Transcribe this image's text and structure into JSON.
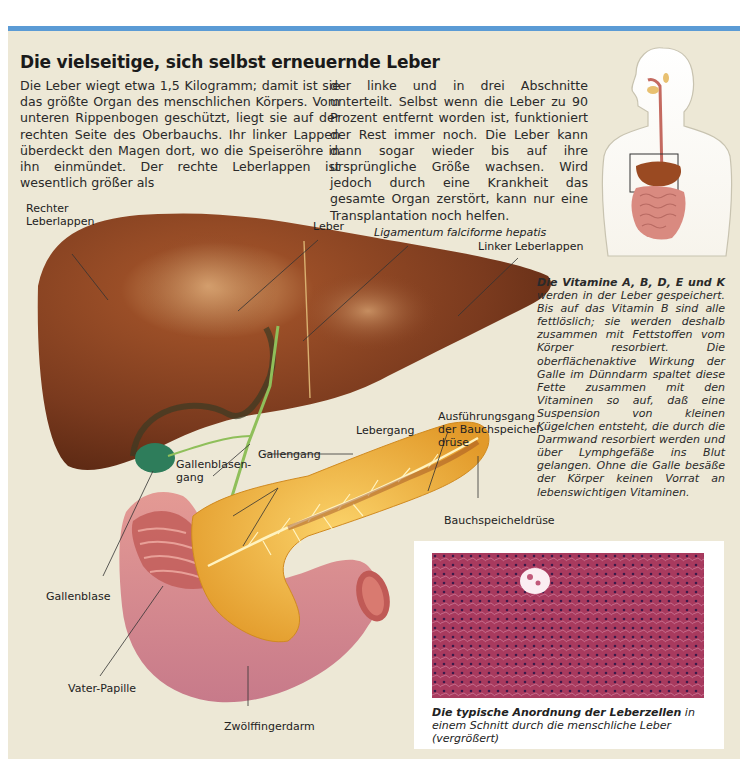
{
  "header": {
    "title": "Die vielseitige, sich selbst erneuernde Leber",
    "accent_color": "#5b9bd5",
    "background_color": "#ede8d6"
  },
  "intro": {
    "column1": "Die Leber wiegt etwa 1,5 Kilogramm; damit ist sie das größte Organ des menschlichen Körpers. Vom unteren Rippenbogen geschützt, liegt sie auf der rechten Seite des Oberbauchs. Ihr linker Lappen überdeckt den Magen dort, wo die Speiseröhre in ihn einmündet. Der rechte Leberlappen ist wesentlich größer als",
    "column2": "der linke und in drei Abschnitte unterteilt. Selbst wenn die Leber zu 90 Prozent entfernt worden ist, funktioniert der Rest immer noch. Die Leber kann dann sogar wieder bis auf ihre ursprüngliche Größe wachsen. Wird jedoch durch eine Krankheit das gesamte Organ zerstört, kann nur eine Transplantation noch helfen."
  },
  "labels": {
    "rechter_leberlappen_1": "Rechter",
    "rechter_leberlappen_2": "Leberlappen",
    "leber": "Leber",
    "ligamentum": "Ligamentum falciforme hepatis",
    "linker_leberlappen": "Linker Leberlappen",
    "ausfuehrungsgang_1": "Ausführungsgang",
    "ausfuehrungsgang_2": "der Bauchspeichel-",
    "ausfuehrungsgang_3": "drüse",
    "lebergang": "Lebergang",
    "gallenblasengang_1": "Gallenblasen-",
    "gallenblasengang_2": "gang",
    "gallengang": "Gallengang",
    "bauchspeicheldruese": "Bauchspeicheldrüse",
    "gallenblase": "Gallenblase",
    "vater_papille": "Vater-Papille",
    "zwoelffingerdarm": "Zwölffingerdarm"
  },
  "sidebar": {
    "heading": "Die Vitamine A, B, D, E und K",
    "body": "werden in der Leber gespeichert. Bis auf das Vitamin B sind alle fettlöslich; sie werden deshalb zusammen mit Fettstoffen vom Körper resorbiert. Die oberflächenaktive Wirkung der Galle im Dünndarm spaltet diese Fette zusammen mit den Vitaminen so auf, daß eine Suspension von kleinen Kügelchen entsteht, die durch die Darmwand resorbiert werden und über Lymphgefäße ins Blut gelangen. Ohne die Galle besäße der Körper keinen Vorrat an lebenswichtigen Vitaminen."
  },
  "micrograph": {
    "caption_bold": "Die typische Anordnung der Leberzellen",
    "caption_rest": " in einem Schnitt durch die menschliche Leber (vergrößert)",
    "tissue_color": "#a23a5c"
  },
  "colors": {
    "liver": "#7a3a1e",
    "pancreas": "#f0b640",
    "duodenum": "#d98a8a",
    "gallbladder": "#2e7d5b",
    "bile_duct": "#8fbf5a"
  }
}
